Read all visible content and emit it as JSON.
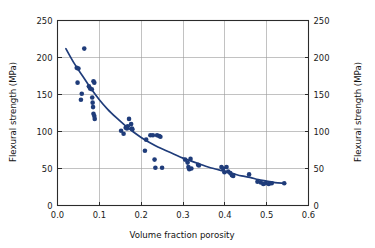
{
  "chart_data": {
    "type": "scatter",
    "title": "",
    "xlabel": "Volume fraction porosity",
    "ylabel": "Flexural strength (MPa)",
    "ylabel_right": "Flexural strength (MPa)",
    "xlim": [
      0.0,
      0.6
    ],
    "ylim": [
      0,
      250
    ],
    "xticks": [
      0.0,
      0.1,
      0.2,
      0.3,
      0.4,
      0.5,
      0.6
    ],
    "xtick_labels": [
      "0.0",
      "0.1",
      "0.2",
      "0.3",
      "0.4",
      "0.5",
      "0.6"
    ],
    "yticks": [
      0,
      50,
      100,
      150,
      200,
      250
    ],
    "ytick_labels": [
      "0",
      "50",
      "100",
      "150",
      "200",
      "250"
    ],
    "yticks_right": [
      0,
      50,
      100,
      150,
      200,
      250
    ],
    "ytick_labels_right": [
      "0",
      "50",
      "100",
      "150",
      "200",
      "250"
    ],
    "grid": true,
    "grid_x": true,
    "grid_y": true,
    "legend": null,
    "marker_color": "#1f3c7a",
    "curve_color": "#1f3c7a",
    "marker_size": 2.3,
    "series": [
      {
        "name": "measurements",
        "type": "scatter",
        "points": [
          [
            0.046,
            186
          ],
          [
            0.05,
            185
          ],
          [
            0.048,
            166
          ],
          [
            0.058,
            151
          ],
          [
            0.056,
            143
          ],
          [
            0.064,
            212
          ],
          [
            0.075,
            161
          ],
          [
            0.078,
            158
          ],
          [
            0.082,
            157
          ],
          [
            0.086,
            168
          ],
          [
            0.088,
            166
          ],
          [
            0.083,
            146
          ],
          [
            0.084,
            139
          ],
          [
            0.085,
            133
          ],
          [
            0.086,
            124
          ],
          [
            0.088,
            121
          ],
          [
            0.089,
            117
          ],
          [
            0.152,
            101
          ],
          [
            0.158,
            97
          ],
          [
            0.163,
            105
          ],
          [
            0.166,
            104
          ],
          [
            0.168,
            107
          ],
          [
            0.171,
            117
          ],
          [
            0.176,
            110
          ],
          [
            0.178,
            104
          ],
          [
            0.179,
            103
          ],
          [
            0.209,
            74
          ],
          [
            0.212,
            89
          ],
          [
            0.222,
            95
          ],
          [
            0.228,
            95
          ],
          [
            0.232,
            62
          ],
          [
            0.234,
            51
          ],
          [
            0.238,
            95
          ],
          [
            0.243,
            94
          ],
          [
            0.246,
            93
          ],
          [
            0.25,
            51
          ],
          [
            0.305,
            62
          ],
          [
            0.311,
            58
          ],
          [
            0.313,
            52
          ],
          [
            0.315,
            49
          ],
          [
            0.318,
            63
          ],
          [
            0.32,
            50
          ],
          [
            0.336,
            55
          ],
          [
            0.338,
            54
          ],
          [
            0.392,
            52
          ],
          [
            0.396,
            50
          ],
          [
            0.399,
            45
          ],
          [
            0.404,
            52
          ],
          [
            0.408,
            46
          ],
          [
            0.413,
            44
          ],
          [
            0.417,
            41
          ],
          [
            0.42,
            40
          ],
          [
            0.458,
            42
          ],
          [
            0.478,
            32
          ],
          [
            0.486,
            31
          ],
          [
            0.492,
            29
          ],
          [
            0.497,
            30
          ],
          [
            0.505,
            29
          ],
          [
            0.512,
            30
          ],
          [
            0.542,
            30
          ]
        ]
      },
      {
        "name": "fitted-curve",
        "type": "line",
        "points": [
          [
            0.02,
            212
          ],
          [
            0.04,
            192
          ],
          [
            0.06,
            175
          ],
          [
            0.08,
            158
          ],
          [
            0.1,
            143
          ],
          [
            0.12,
            130
          ],
          [
            0.14,
            119
          ],
          [
            0.16,
            109
          ],
          [
            0.18,
            100
          ],
          [
            0.2,
            92
          ],
          [
            0.22,
            85
          ],
          [
            0.24,
            79
          ],
          [
            0.26,
            74
          ],
          [
            0.28,
            69
          ],
          [
            0.3,
            64
          ],
          [
            0.32,
            60
          ],
          [
            0.34,
            56
          ],
          [
            0.36,
            52
          ],
          [
            0.38,
            49
          ],
          [
            0.4,
            46
          ],
          [
            0.42,
            43
          ],
          [
            0.44,
            40
          ],
          [
            0.46,
            38
          ],
          [
            0.48,
            35
          ],
          [
            0.5,
            33
          ],
          [
            0.52,
            31
          ],
          [
            0.54,
            30
          ]
        ]
      }
    ]
  },
  "figure": {
    "background_color": "#ffffff",
    "axis_color": "#2b2b2b",
    "grid_color": "#9a9a9a"
  }
}
